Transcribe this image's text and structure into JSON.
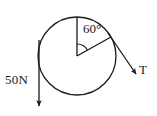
{
  "figure": {
    "stroke_color": "#1a1a1a",
    "background_color": "#ffffff",
    "labels": {
      "angle": "60°",
      "tension": "T",
      "weight": "50N"
    },
    "geometry": {
      "circle_center_x": 77,
      "circle_center_y": 56,
      "circle_radius": 39,
      "angle_degrees": 60,
      "vertical_radius_top_x": 77,
      "vertical_radius_top_y": 17,
      "inclined_radius_end_x": 111,
      "inclined_radius_end_y": 37,
      "tension_arrow_end_x": 136,
      "tension_arrow_end_y": 74,
      "weight_arrow_x": 39,
      "weight_arrow_top_y": 40,
      "weight_arrow_end_y": 108
    }
  }
}
